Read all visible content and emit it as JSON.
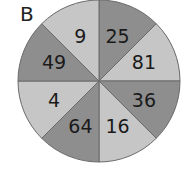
{
  "panel_label": "B",
  "colors": {
    "light": "#c6c6c6",
    "dark": "#8e8e8e",
    "stroke": "#6a6a6a"
  },
  "sectors": [
    {
      "value": "25",
      "shade": "dark"
    },
    {
      "value": "81",
      "shade": "light"
    },
    {
      "value": "36",
      "shade": "dark"
    },
    {
      "value": "16",
      "shade": "light"
    },
    {
      "value": "64",
      "shade": "dark"
    },
    {
      "value": "4",
      "shade": "light"
    },
    {
      "value": "49",
      "shade": "dark"
    },
    {
      "value": "9",
      "shade": "light"
    }
  ]
}
